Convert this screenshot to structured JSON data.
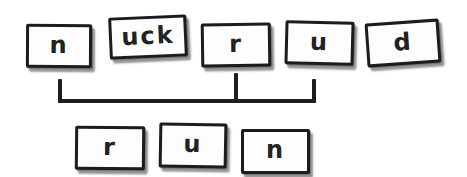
{
  "diagram": {
    "top_row": [
      {
        "label": "n"
      },
      {
        "label": "uck"
      },
      {
        "label": "r"
      },
      {
        "label": "u"
      },
      {
        "label": "d"
      }
    ],
    "bracket": {
      "connects": [
        "n",
        "r",
        "u"
      ]
    },
    "bottom_row": [
      {
        "label": "r"
      },
      {
        "label": "u"
      },
      {
        "label": "n"
      }
    ],
    "colors": {
      "ink": "#1c1c1c",
      "tile_fill": "#fdfdfd",
      "background": "#ffffff"
    }
  }
}
